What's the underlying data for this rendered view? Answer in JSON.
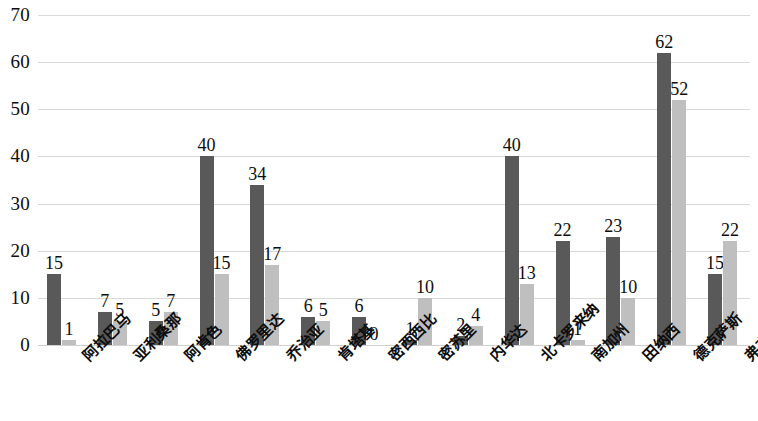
{
  "chart_data": {
    "type": "bar",
    "title": "",
    "subtitle": "",
    "xlabel": "",
    "ylabel": "",
    "ylim": [
      0,
      70
    ],
    "ytick_step": 10,
    "yticks": [
      0,
      10,
      20,
      30,
      40,
      50,
      60,
      70
    ],
    "ytick_labels": [
      "0",
      "10",
      "20",
      "30",
      "40",
      "50",
      "60",
      "70"
    ],
    "grid": true,
    "legend": false,
    "legend_position": "none",
    "data_labels": true,
    "categories": [
      "阿拉巴马",
      "亚利桑那",
      "阿肯色",
      "佛罗里达",
      "乔治亚",
      "肯塔基",
      "密西西比",
      "密苏里",
      "内华达",
      "北卡罗来纳",
      "南加州",
      "田纳西",
      "德克萨斯",
      "弗吉尼亚"
    ],
    "series": [
      {
        "name": "series-1",
        "color": "#595959",
        "values": [
          15,
          7,
          5,
          40,
          34,
          6,
          6,
          1,
          2,
          40,
          22,
          23,
          62,
          15
        ]
      },
      {
        "name": "series-2",
        "color": "#bfbfbf",
        "values": [
          1,
          5,
          7,
          15,
          17,
          5,
          0,
          10,
          4,
          13,
          1,
          10,
          52,
          22
        ]
      }
    ]
  },
  "colors": {
    "series_dark": "#595959",
    "series_light": "#bfbfbf",
    "gridline": "#d9d9d9",
    "text": "#0d0d0d",
    "background": "#ffffff"
  }
}
